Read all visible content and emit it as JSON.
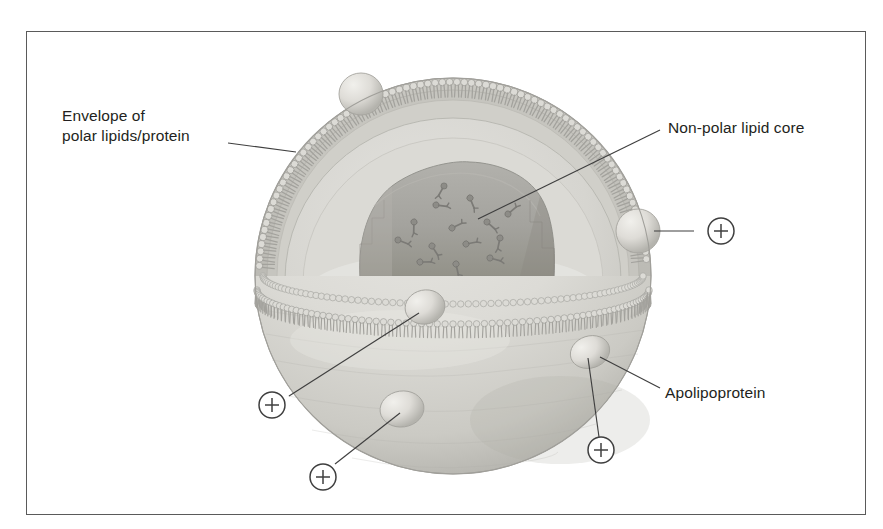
{
  "figure": {
    "frame": {
      "border_color": "#5a5a5a",
      "background": "#ffffff"
    }
  },
  "labels": [
    {
      "id": "envelope",
      "name": "envelope-label",
      "line1": "Envelope of",
      "line2": "polar lipids/protein"
    },
    {
      "id": "core",
      "name": "core-label",
      "text": "Non-polar lipid core"
    },
    {
      "id": "apolipoprotein",
      "name": "apolipoprotein-label",
      "text": "Apolipoprotein"
    }
  ],
  "markers": {
    "symbol": "plus-in-circle",
    "glyph": "+",
    "count": 4,
    "items": [
      {
        "id": "marker-right",
        "name": "marker-plus-right",
        "x": 721,
        "y": 231
      },
      {
        "id": "marker-left",
        "name": "marker-plus-left",
        "x": 272,
        "y": 405
      },
      {
        "id": "marker-bottom-left",
        "name": "marker-plus-bottom-left",
        "x": 323,
        "y": 477
      },
      {
        "id": "marker-bottom-right",
        "name": "marker-plus-bottom-right",
        "x": 601,
        "y": 450
      }
    ]
  },
  "diagram": {
    "particle": {
      "name": "lipoprotein-particle",
      "center_x": 453,
      "center_y": 276,
      "radius": 198
    },
    "components": [
      {
        "name": "phospholipid-monolayer",
        "description": "Envelope of polar lipids and protein"
      },
      {
        "name": "lipid-core",
        "description": "Non-polar lipid core"
      },
      {
        "name": "apolipoprotein-bump",
        "description": "Apolipoprotein embedded in envelope"
      }
    ]
  },
  "colors": {
    "outline": "#5a5a5a",
    "leader_line": "#3f3f3f",
    "text": "#231f20",
    "sphere_light": "#e4e3df",
    "sphere_mid": "#d2d1cc",
    "sphere_shadow": "#bcbbb6",
    "core_fill": "#a9a8a3",
    "core_dark": "#9a9995",
    "membrane_head": "#d8d7d2",
    "membrane_tail": "#a8a7a2",
    "cavity_light": "#dedddA"
  }
}
